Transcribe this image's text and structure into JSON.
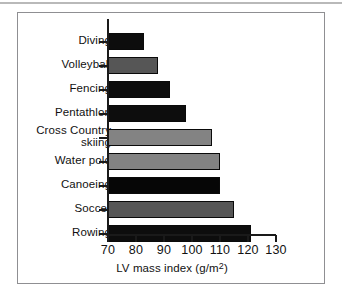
{
  "figure": {
    "frame_border_color": "#8f8f92",
    "background": "#ffffff"
  },
  "axis": {
    "x_title_main": "LV mass index (g/m",
    "x_title_sup": "2",
    "x_title_close": ")",
    "x_title_full": "LV mass index (g/m2)",
    "ticks": [
      "70",
      "80",
      "90",
      "100",
      "110",
      "120",
      "130"
    ],
    "xmin": 70,
    "xmax": 130
  },
  "chart_data": {
    "type": "bar",
    "orientation": "horizontal",
    "title": "",
    "xlabel": "LV mass index (g/m2)",
    "ylabel": "",
    "xlim": [
      70,
      130
    ],
    "grid": false,
    "legend": null,
    "categories": [
      "Diving",
      "Volleyball",
      "Fencing",
      "Pentathlon",
      "Cross Country\nskiing",
      "Water polo",
      "Canoeing",
      "Soccer",
      "Rowing"
    ],
    "values": [
      83,
      88,
      92,
      98,
      107,
      110,
      110,
      115,
      121
    ],
    "colors": [
      "#0d0d0d",
      "#565656",
      "#0d0d0d",
      "#0d0d0d",
      "#838383",
      "#838383",
      "#060606",
      "#565656",
      "#0d0d0d"
    ]
  }
}
